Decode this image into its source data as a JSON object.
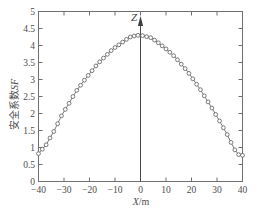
{
  "chart_data": {
    "type": "line",
    "title": "",
    "subtitle": "",
    "xlabel": "X/m",
    "xlabel_symbol": "X",
    "xlabel_unit": "/m",
    "ylabel": "安全系数SF",
    "ylabel_cn": "安全系数",
    "ylabel_sym": "SF",
    "xlim": [
      -40,
      40
    ],
    "ylim": [
      0,
      5
    ],
    "xticks": [
      -40,
      -30,
      -20,
      -10,
      0,
      10,
      20,
      30,
      40
    ],
    "xtick_labels": [
      "-40",
      "-30",
      "-20",
      "-10",
      "0",
      "10",
      "20",
      "30",
      "40"
    ],
    "yticks": [
      0,
      0.5,
      1,
      1.5,
      2,
      2.5,
      3,
      3.5,
      4,
      4.5,
      5
    ],
    "ytick_labels": [
      "0",
      "0.5",
      "1",
      "1.5",
      "2",
      "2.5",
      "3",
      "3.5",
      "4",
      "4.5",
      "5"
    ],
    "grid": false,
    "legend": null,
    "marker": "open-circle",
    "line_color": "#5a5a5a",
    "marker_color": "#5a5a5a",
    "annotations": [
      {
        "name": "z-axis-arrow",
        "label": "Z",
        "x": 0,
        "type": "vertical-axis-arrow"
      }
    ],
    "series": [
      {
        "name": "SF",
        "x": [
          -40,
          -38.5,
          -37,
          -35.5,
          -34,
          -32.5,
          -31,
          -29.5,
          -28,
          -26.5,
          -25,
          -23.5,
          -22,
          -20.5,
          -19,
          -17.5,
          -16,
          -14.5,
          -13,
          -11.5,
          -10,
          -8.5,
          -7,
          -5.5,
          -4,
          -2.5,
          -1,
          0.8,
          2.4,
          4,
          5.5,
          7,
          8.5,
          10,
          11.5,
          13,
          14.5,
          16,
          17.5,
          19,
          20.5,
          22,
          23.5,
          25,
          26.5,
          28,
          29.5,
          31,
          32.5,
          34,
          35.5,
          37,
          38.5,
          40
        ],
        "y": [
          0.82,
          0.95,
          1.08,
          1.28,
          1.47,
          1.7,
          1.93,
          2.12,
          2.3,
          2.5,
          2.68,
          2.83,
          2.98,
          3.12,
          3.26,
          3.4,
          3.52,
          3.63,
          3.74,
          3.85,
          3.94,
          4.02,
          4.1,
          4.18,
          4.25,
          4.28,
          4.3,
          4.29,
          4.26,
          4.23,
          4.16,
          4.08,
          3.99,
          3.9,
          3.8,
          3.7,
          3.58,
          3.45,
          3.32,
          3.18,
          3.02,
          2.86,
          2.7,
          2.52,
          2.34,
          2.16,
          1.97,
          1.78,
          1.58,
          1.38,
          1.15,
          0.93,
          0.79,
          0.77
        ]
      }
    ]
  }
}
